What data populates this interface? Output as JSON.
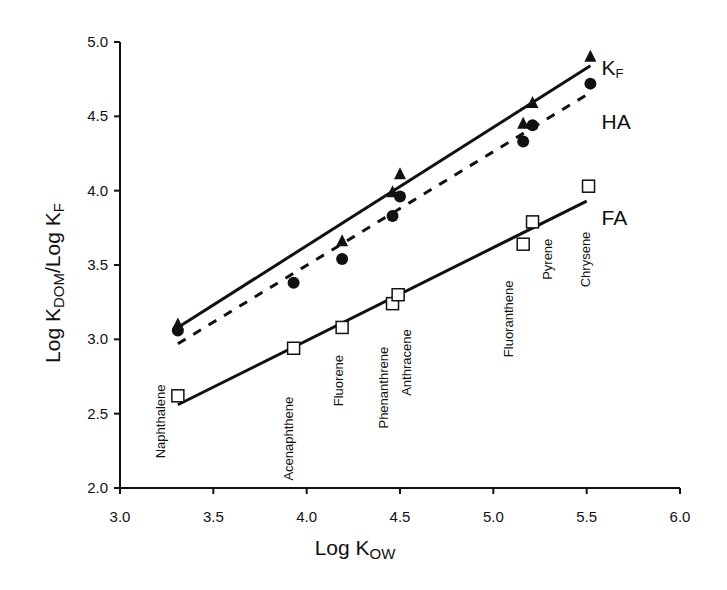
{
  "chart_data": {
    "type": "scatter",
    "title": "",
    "xlabel": "Log K_OW",
    "xlabel_main": "Log K",
    "xlabel_sub": "OW",
    "ylabel": "Log K_DOM/Log K_F",
    "ylabel_parts": {
      "a": "Log K",
      "a_sub": "DOM",
      "b": "/Log K",
      "b_sub": "F"
    },
    "xlim": [
      3.0,
      6.0
    ],
    "ylim": [
      2.0,
      5.0
    ],
    "xticks": [
      "3.0",
      "3.5",
      "4.0",
      "4.5",
      "5.0",
      "5.5",
      "6.0"
    ],
    "yticks": [
      "2.0",
      "2.5",
      "3.0",
      "3.5",
      "4.0",
      "4.5",
      "5.0"
    ],
    "grid": false,
    "legend": "inline labels at right end of each series line",
    "compounds": [
      {
        "name": "Naphthalene",
        "x": 3.31,
        "label_y": 2.2
      },
      {
        "name": "Acenaphthene",
        "x": 3.93,
        "label_y": 2.05
      },
      {
        "name": "Fluorene",
        "x": 4.19,
        "label_y": 2.55
      },
      {
        "name": "Phenanthrene",
        "x": 4.46,
        "label_y": 2.4
      },
      {
        "name": "Anthracene",
        "x": 4.5,
        "label_y": 2.62
      },
      {
        "name": "Fluoranthene",
        "x": 5.16,
        "label_y": 2.88
      },
      {
        "name": "Pyrene",
        "x": 5.21,
        "label_y": 3.4
      },
      {
        "name": "Chrysene",
        "x": 5.52,
        "label_y": 3.35
      }
    ],
    "series": [
      {
        "name": "K",
        "name_sub": "F",
        "marker": "triangle-filled",
        "line": "solid",
        "x": [
          3.31,
          4.19,
          4.46,
          4.5,
          5.16,
          5.21,
          5.52
        ],
        "values": [
          3.1,
          3.66,
          3.99,
          4.11,
          4.45,
          4.59,
          4.9
        ],
        "fit": {
          "x": [
            3.31,
            5.52
          ],
          "y": [
            3.08,
            4.84
          ]
        },
        "label_pos": {
          "x": 5.58,
          "y": 4.83
        }
      },
      {
        "name": "HA",
        "name_sub": "",
        "marker": "circle-filled",
        "line": "dashed",
        "x": [
          3.31,
          3.93,
          4.19,
          4.46,
          4.5,
          5.16,
          5.21,
          5.52
        ],
        "values": [
          3.06,
          3.38,
          3.54,
          3.83,
          3.96,
          4.33,
          4.44,
          4.72
        ],
        "fit": {
          "x": [
            3.31,
            5.52
          ],
          "y": [
            2.97,
            4.66
          ]
        },
        "label_pos": {
          "x": 5.58,
          "y": 4.47
        }
      },
      {
        "name": "FA",
        "name_sub": "",
        "marker": "square-open",
        "line": "solid",
        "x": [
          3.31,
          3.93,
          4.19,
          4.46,
          4.49,
          5.16,
          5.21,
          5.51
        ],
        "values": [
          2.62,
          2.94,
          3.08,
          3.24,
          3.3,
          3.64,
          3.79,
          4.03
        ],
        "fit": {
          "x": [
            3.31,
            5.5
          ],
          "y": [
            2.56,
            3.93
          ]
        },
        "label_pos": {
          "x": 5.58,
          "y": 3.82
        }
      }
    ]
  }
}
